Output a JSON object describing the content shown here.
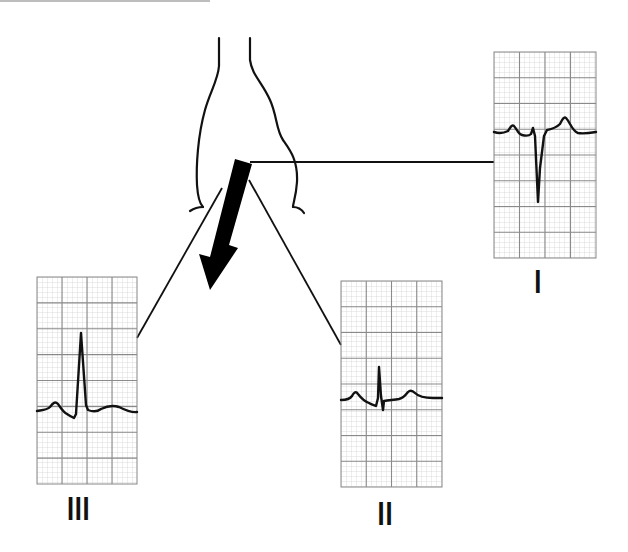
{
  "colors": {
    "grid_minor": "#c9c9c9",
    "grid_major": "#8a8a8a",
    "trace": "#111111",
    "ink": "#111111",
    "background": "#ffffff"
  },
  "heart": {
    "label": "heart-outline",
    "axis_arrow": "mean-electrical-axis-arrow"
  },
  "leads": [
    {
      "id": "I",
      "label": "I",
      "grid": {
        "x": 494,
        "y": 52,
        "w": 102,
        "h": 206
      },
      "label_pos": {
        "x": 536,
        "y": 268
      },
      "qrs": "negative",
      "description": "Small P wave, deep narrow negative QRS (S), upright T wave"
    },
    {
      "id": "II",
      "label": "II",
      "grid": {
        "x": 341,
        "y": 281,
        "w": 101,
        "h": 206
      },
      "label_pos": {
        "x": 377,
        "y": 500
      },
      "qrs": "biphasic",
      "description": "Small P wave, small positive R then negative S, small upright T"
    },
    {
      "id": "III",
      "label": "III",
      "grid": {
        "x": 37,
        "y": 277,
        "w": 100,
        "h": 207
      },
      "label_pos": {
        "x": 70,
        "y": 494
      },
      "qrs": "positive",
      "description": "Small P wave, tall positive R, flat T"
    }
  ]
}
